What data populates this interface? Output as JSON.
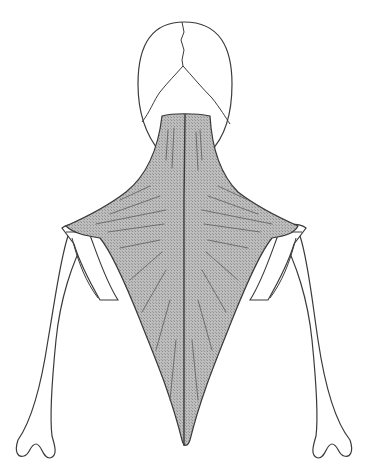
{
  "figure": {
    "subject": "Trapezius muscle, posterior view",
    "parts": [
      "skull",
      "neck",
      "trapezius-muscle",
      "left-scapula",
      "right-scapula",
      "left-humerus",
      "right-humerus",
      "spine-midline"
    ],
    "colors": {
      "outline": "#3a3a3a",
      "muscle_fill": "#b9b9b9",
      "muscle_fiber": "#6e6e6e",
      "bone_fill": "#ffffff",
      "background": "#ffffff"
    }
  }
}
